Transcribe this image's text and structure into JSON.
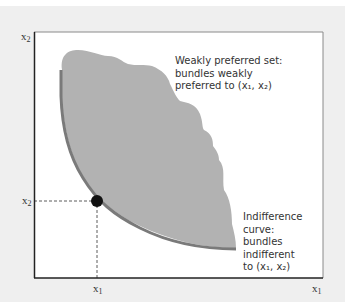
{
  "figure": {
    "axes": {
      "y_label": "x",
      "y_label_sub": "2",
      "x_label": "x",
      "x_label_sub": "1"
    },
    "point": {
      "x_tick": "x",
      "x_tick_sub": "1",
      "y_tick": "x",
      "y_tick_sub": "2"
    },
    "annotations": {
      "weakly_preferred": [
        "Weakly preferred set:",
        "bundles weakly",
        "preferred to (x₁, x₂)"
      ],
      "indifference": [
        "Indifference",
        "curve:",
        "bundles",
        "indifferent",
        "to (x₁, x₂)"
      ]
    },
    "colors": {
      "panel_bg": "#efefef",
      "plot_bg": "#ffffff",
      "preferred_set_fill": "#b2b2b2",
      "indifference_curve": "#7a7a7a",
      "point": "#111111",
      "axis": "#222222"
    }
  }
}
